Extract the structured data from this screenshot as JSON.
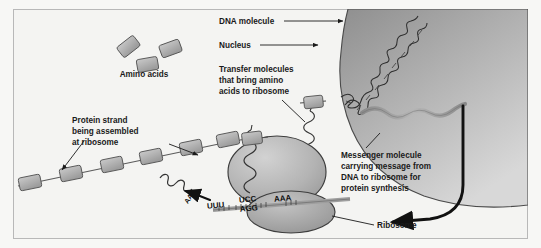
{
  "figure": {
    "background_color": "#f7f7f5",
    "border_color": "#b8b8b8",
    "ink_color": "#1a1a1a"
  },
  "labels": {
    "amino_acids": "Amino acids",
    "dna_molecule": "DNA molecule",
    "nucleus": "Nucleus",
    "transfer_molecules": [
      "Transfer molecules",
      "that bring amino",
      "acids to ribosome"
    ],
    "protein_strand": [
      "Protein strand",
      "being assembled",
      "at ribosome"
    ],
    "messenger_molecule": [
      "Messenger molecule",
      "carrying message from",
      "DNA to ribosome for",
      "protein synthesis"
    ],
    "ribosome": "Ribosome"
  },
  "codons": {
    "incoming_trna_anticodon": "UUU",
    "site_a_anticodon": "UCC",
    "site_a_codon": "AGG",
    "next_codon": "AAA",
    "exiting_codon": "UUU",
    "departing_trna_anticodon": "AAA"
  },
  "structures": {
    "nucleus_fill_light": "#d5d5d5",
    "nucleus_fill_dark": "#9a9a9a",
    "ribosome_large_fill": "#b9b9b9",
    "ribosome_small_fill": "#a8a8a8",
    "amino_acid_fill": "#b4b4b4",
    "amino_acid_stroke": "#555555",
    "mrna_fill": "#9e9e9e",
    "coil_stroke": "#333333"
  },
  "counts": {
    "free_amino_acids": 3,
    "protein_chain_blocks": 6,
    "trna_in_ribosome": 2
  }
}
